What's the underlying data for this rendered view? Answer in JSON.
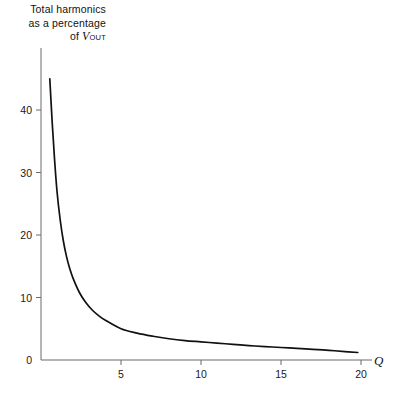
{
  "figure": {
    "background_color": "#ffffff",
    "line_color": "#111111",
    "axis_color": "#6b6b6b"
  },
  "labels": {
    "ylabel_line1": "Total harmonics",
    "ylabel_line2": "as a percentage",
    "ylabel_line3_prefix": "of ",
    "ylabel_line3_symbol": "V",
    "ylabel_line3_subscript": "OUT",
    "xlabel": "Q"
  },
  "chart_data": {
    "type": "line",
    "title": "",
    "xlabel": "Q",
    "ylabel": "Total harmonics as a percentage of VOUT",
    "xlim": [
      0,
      20.6
    ],
    "ylim": [
      0,
      48
    ],
    "xticks": [
      5,
      10,
      15,
      20
    ],
    "xtick_labels": [
      "5",
      "10",
      "15",
      "20"
    ],
    "yticks": [
      0,
      10,
      20,
      30,
      40
    ],
    "ytick_labels": [
      "0",
      "10",
      "20",
      "30",
      "40"
    ],
    "grid": false,
    "legend": null,
    "series": [
      {
        "name": "Total harmonic distortion",
        "x": [
          0.55,
          0.7,
          0.85,
          1.0,
          1.2,
          1.4,
          1.6,
          1.8,
          2.0,
          2.4,
          2.8,
          3.2,
          3.6,
          4.0,
          5.0,
          6.0,
          7.0,
          8.0,
          9.0,
          10.0,
          11.0,
          12.0,
          13.0,
          14.0,
          15.0,
          16.0,
          17.0,
          18.0,
          19.0,
          19.8
        ],
        "y": [
          45.0,
          38.0,
          32.0,
          27.0,
          22.4,
          19.0,
          16.5,
          14.6,
          13.1,
          10.8,
          9.2,
          8.0,
          7.1,
          6.4,
          5.0,
          4.3,
          3.8,
          3.4,
          3.1,
          2.9,
          2.7,
          2.5,
          2.3,
          2.15,
          2.0,
          1.85,
          1.7,
          1.55,
          1.35,
          1.2
        ]
      }
    ]
  }
}
